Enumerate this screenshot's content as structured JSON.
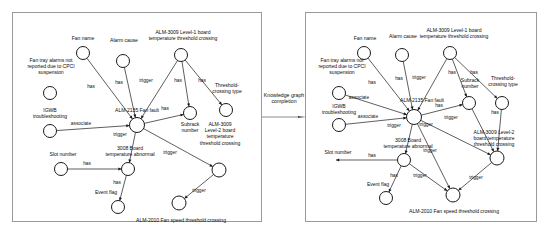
{
  "figure": {
    "transform_label": "Knowledge\ngraph\ncompletion",
    "arrow_icon": "right-arrow-icon"
  },
  "panels": [
    {
      "id": "before",
      "nodes": [
        {
          "id": "alarm_cause",
          "label": "Alarm cause",
          "cx": 110,
          "cy": 48,
          "r": 6.5,
          "label_x": 83,
          "label_y": 24,
          "label_w": 56
        },
        {
          "id": "fan_name",
          "label": "Fan name",
          "cx": 70,
          "cy": 40,
          "r": 6.5,
          "label_x": 44,
          "label_y": 22,
          "label_w": 52
        },
        {
          "id": "fan_tray",
          "label": "Fan tray alarms not\nreported due to CPCI\nsuspension",
          "cx": 37,
          "cy": 80,
          "r": 6.5,
          "label_x": -2,
          "label_y": 44,
          "label_w": 80
        },
        {
          "id": "igwb",
          "label": "IGWB\ntroubleshooting",
          "cx": 37,
          "cy": 118,
          "r": 6.5,
          "label_x": 3,
          "label_y": 94,
          "label_w": 68
        },
        {
          "id": "alm2135",
          "label": "ALM-2135 Fan fault",
          "cx": 124,
          "cy": 112,
          "r": 7.5,
          "label_x": 77,
          "label_y": 94,
          "label_w": 94
        },
        {
          "id": "alm3009_l1",
          "label": "ALM-3009 Level-1 board\ntemperature threshold crossing",
          "cx": 168,
          "cy": 42,
          "r": 6.5,
          "label_x": 110,
          "label_y": 16,
          "label_w": 120
        },
        {
          "id": "subrack",
          "label": "Subrack\nnumber",
          "cx": 177,
          "cy": 100,
          "r": 6.5,
          "label_x": 155,
          "label_y": 108,
          "label_w": 44
        },
        {
          "id": "threshold_type",
          "label": "Threshold-\ncrossing type",
          "cx": 213,
          "cy": 97,
          "r": 6.5,
          "label_x": 188,
          "label_y": 69,
          "label_w": 52
        },
        {
          "id": "alm3009_l2",
          "label": "ALM-3009\nLevel-2 board\ntemperature\nthreshold crossing",
          "cx": 206,
          "cy": 157,
          "r": 7.0,
          "label_x": 172,
          "label_y": 108,
          "label_w": 70
        },
        {
          "id": "board3008",
          "label": "3008 Board\ntemperature abnormal",
          "cx": 115,
          "cy": 156,
          "r": 6.5,
          "label_x": 75,
          "label_y": 132,
          "label_w": 84
        },
        {
          "id": "slot_number",
          "label": "Slot number",
          "cx": 48,
          "cy": 156,
          "r": 6.5,
          "label_x": 24,
          "label_y": 138,
          "label_w": 52
        },
        {
          "id": "event_flag",
          "label": "Event flag",
          "cx": 105,
          "cy": 194,
          "r": 6.5,
          "label_x": 69,
          "label_y": 176,
          "label_w": 48
        },
        {
          "id": "alm2010",
          "label": "ALM-2010 Fan speed threshold crossing",
          "cx": 166,
          "cy": 190,
          "r": 7.0,
          "label_x": 100,
          "label_y": 204,
          "label_w": 136
        }
      ],
      "edges": [
        {
          "from": "fan_name",
          "to": "alm2135",
          "label": "has",
          "label_x": 78,
          "label_y": 74
        },
        {
          "from": "alarm_cause",
          "to": "alm2135",
          "label": "has",
          "label_x": 106,
          "label_y": 70
        },
        {
          "from": "alm3009_l1",
          "to": "alm2135",
          "label": "trigger",
          "label_x": 133,
          "label_y": 68
        },
        {
          "from": "alm3009_l1",
          "to": "subrack",
          "label": "has",
          "label_x": 165,
          "label_y": 68
        },
        {
          "from": "alm3009_l1",
          "to": "threshold_type",
          "label": "has",
          "label_x": 189,
          "label_y": 68
        },
        {
          "from": "igwb",
          "to": "alm2135",
          "label": "associate",
          "label_x": 68,
          "label_y": 111
        },
        {
          "from": "alm2135",
          "to": "board3008",
          "label": "trigger",
          "label_x": 107,
          "label_y": 122
        },
        {
          "from": "alm2135",
          "to": "alm3009_l2",
          "label": "trigger",
          "label_x": 157,
          "label_y": 140
        },
        {
          "from": "alm2135",
          "to": "subrack",
          "label": "has",
          "label_x": 152,
          "label_y": 96
        },
        {
          "from": "slot_number",
          "to": "board3008",
          "label": "has",
          "label_x": 74,
          "label_y": 151
        },
        {
          "from": "board3008",
          "to": "event_flag",
          "label": "has",
          "label_x": 104,
          "label_y": 170
        },
        {
          "from": "alm3009_l2",
          "to": "alm2010",
          "label": "trigger",
          "label_x": 186,
          "label_y": 178
        }
      ]
    },
    {
      "id": "after",
      "nodes": [
        {
          "id": "alarm_cause",
          "label": "Alarm cause",
          "cx": 96,
          "cy": 42,
          "r": 6.5,
          "label_x": 69,
          "label_y": 20,
          "label_w": 56
        },
        {
          "id": "fan_name",
          "label": "Fan name",
          "cx": 58,
          "cy": 40,
          "r": 6.5,
          "label_x": 33,
          "label_y": 22,
          "label_w": 52
        },
        {
          "id": "fan_tray",
          "label": "Fan tray alarms not\nreported due to CPCI\nsuspension",
          "cx": 33,
          "cy": 80,
          "r": 6.5,
          "label_x": -4,
          "label_y": 44,
          "label_w": 80
        },
        {
          "id": "igwb",
          "label": "IGWB\ntroubleshooting",
          "cx": 33,
          "cy": 112,
          "r": 6.5,
          "label_x": -1,
          "label_y": 90,
          "label_w": 68
        },
        {
          "id": "alm2135",
          "label": "ALM-2135 Fan fault",
          "cx": 108,
          "cy": 104,
          "r": 7.5,
          "label_x": 69,
          "label_y": 84,
          "label_w": 94
        },
        {
          "id": "alm3009_l1",
          "label": "ALM-3009 Level-1 board\ntemperature threshold crossing",
          "cx": 144,
          "cy": 40,
          "r": 6.5,
          "label_x": 88,
          "label_y": 14,
          "label_w": 120
        },
        {
          "id": "subrack",
          "label": "Subrack\nnumber",
          "cx": 163,
          "cy": 90,
          "r": 6.5,
          "label_x": 142,
          "label_y": 64,
          "label_w": 44
        },
        {
          "id": "threshold_type",
          "label": "Threshold-\ncrossing type",
          "cx": 196,
          "cy": 90,
          "r": 6.5,
          "label_x": 172,
          "label_y": 62,
          "label_w": 50
        },
        {
          "id": "alm3009_l2",
          "label": "ALM-3009 Level-2\nboard temperature\nthreshold crossing",
          "cx": 191,
          "cy": 145,
          "r": 7.0,
          "label_x": 152,
          "label_y": 116,
          "label_w": 72
        },
        {
          "id": "board3008",
          "label": "3008 Board\ntemperature abnormal",
          "cx": 98,
          "cy": 147,
          "r": 6.5,
          "label_x": 60,
          "label_y": 124,
          "label_w": 84
        },
        {
          "id": "slot_number",
          "label": "Slot number",
          "cx": 30,
          "cy": 147,
          "r": 0,
          "label_x": 8,
          "label_y": 136,
          "label_w": 48
        },
        {
          "id": "event_flag",
          "label": "Event flag",
          "cx": 80,
          "cy": 185,
          "r": 6.5,
          "label_x": 48,
          "label_y": 168,
          "label_w": 48
        },
        {
          "id": "alm2010",
          "label": "ALM-2010 Fan speed threshold crossing",
          "cx": 147,
          "cy": 182,
          "r": 7.0,
          "label_x": 80,
          "label_y": 195,
          "label_w": 136
        }
      ],
      "edges": [
        {
          "from": "fan_name",
          "to": "alm2135",
          "label": "has",
          "label_x": 66,
          "label_y": 70
        },
        {
          "from": "alarm_cause",
          "to": "alm2135",
          "label": "has",
          "label_x": 93,
          "label_y": 66
        },
        {
          "from": "alm3009_l1",
          "to": "alm2135",
          "label": "trigger",
          "label_x": 113,
          "label_y": 65
        },
        {
          "from": "alm3009_l1",
          "to": "subrack",
          "label": "has",
          "label_x": 146,
          "label_y": 60
        },
        {
          "from": "alm3009_l1",
          "to": "threshold_type",
          "label": "has",
          "label_x": 168,
          "label_y": 60
        },
        {
          "from": "fan_tray",
          "to": "alm2135",
          "label": "associate",
          "label_x": 53,
          "label_y": 85
        },
        {
          "from": "igwb",
          "to": "alm2135",
          "label": "associate",
          "label_x": 62,
          "label_y": 104
        },
        {
          "from": "alm2135",
          "to": "subrack",
          "label": "has",
          "label_x": 133,
          "label_y": 93
        },
        {
          "from": "alm2135",
          "to": "board3008",
          "label": "trigger",
          "label_x": 88,
          "label_y": 113
        },
        {
          "from": "alm2135",
          "to": "alm3009_l2",
          "label": "trigger",
          "label_x": 120,
          "label_y": 112
        },
        {
          "from": "alm2135",
          "to": "alm2010",
          "label": "trigger",
          "label_x": 124,
          "label_y": 138
        },
        {
          "from": "threshold_type",
          "to": "alm3009_l2",
          "label": "has",
          "label_x": 189,
          "label_y": 100
        },
        {
          "from": "subrack",
          "to": "alm3009_l2",
          "label": "trigger",
          "label_x": 145,
          "label_y": 105
        },
        {
          "from": "board3008",
          "to": "slot_number",
          "label": "has",
          "label_x": 66,
          "label_y": 143
        },
        {
          "from": "board3008",
          "to": "event_flag",
          "label": "has",
          "label_x": 88,
          "label_y": 163
        },
        {
          "from": "board3008",
          "to": "alm2010",
          "label": "trigger",
          "label_x": 114,
          "label_y": 163
        },
        {
          "from": "alm3009_l2",
          "to": "alm2010",
          "label": "trigger",
          "label_x": 170,
          "label_y": 165
        }
      ]
    }
  ],
  "colors": {
    "stroke": "#1a1a1a",
    "panel_border": "#9a9a9a",
    "background": "#ffffff",
    "text": "#0d0d0d"
  }
}
